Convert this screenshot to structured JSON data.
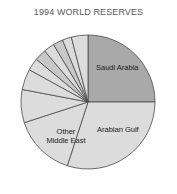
{
  "figure": {
    "title": "1994 WORLD RESERVES",
    "background_color": "#ffffff",
    "title_color": "#5a5a5a"
  },
  "labels": {
    "saudi_arabia": "Saudi Arabia",
    "arabian_gulf": "Arabian Gulf",
    "other_middle_east_line1": "Other",
    "other_middle_east_line2": "Middle East"
  },
  "chart_data": {
    "type": "pie",
    "title": "1994 WORLD RESERVES",
    "xlabel": "",
    "ylabel": "",
    "grid": false,
    "legend": "none",
    "labels_shown_on_slices": true,
    "start_angle_deg": 90,
    "direction": "clockwise",
    "center_px": [
      88,
      102
    ],
    "radius_px": 67,
    "colors": {
      "highlight": "#a9a9a9",
      "default": "#dcdcdc",
      "edge": "#4a4a4a"
    },
    "categories": [
      "Saudi Arabia",
      "Arabian Gulf",
      "Other Middle East",
      "Slice 4",
      "Slice 5",
      "Slice 6",
      "Slice 7",
      "Slice 8",
      "Slice 9",
      "Slice 10",
      "Slice 11"
    ],
    "values": [
      25.0,
      30.0,
      15.0,
      8.0,
      5.0,
      3.0,
      2.8,
      2.6,
      2.4,
      2.2,
      4.0
    ],
    "slices": [
      {
        "label": "Saudi Arabia",
        "value": 25.0,
        "color": "#a9a9a9",
        "labeled": true
      },
      {
        "label": "Arabian Gulf",
        "value": 30.0,
        "color": "#dcdcdc",
        "labeled": true
      },
      {
        "label": "Other Middle East",
        "value": 15.0,
        "color": "#dcdcdc",
        "labeled": true
      },
      {
        "label": "Slice 4",
        "value": 8.0,
        "color": "#dcdcdc",
        "labeled": false
      },
      {
        "label": "Slice 5",
        "value": 5.0,
        "color": "#dcdcdc",
        "labeled": false
      },
      {
        "label": "Slice 6",
        "value": 3.0,
        "color": "#dcdcdc",
        "labeled": false
      },
      {
        "label": "Slice 7",
        "value": 2.8,
        "color": "#c8c8c8",
        "labeled": false
      },
      {
        "label": "Slice 8",
        "value": 2.6,
        "color": "#dcdcdc",
        "labeled": false
      },
      {
        "label": "Slice 9",
        "value": 2.4,
        "color": "#c8c8c8",
        "labeled": false
      },
      {
        "label": "Slice 10",
        "value": 2.2,
        "color": "#dcdcdc",
        "labeled": false
      },
      {
        "label": "Slice 11",
        "value": 4.0,
        "color": "#dcdcdc",
        "labeled": false
      }
    ]
  }
}
